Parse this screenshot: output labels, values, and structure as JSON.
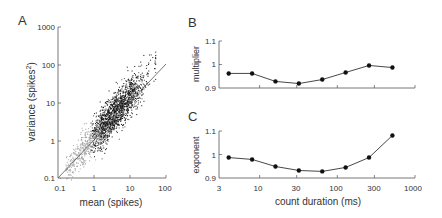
{
  "chart_data": [
    {
      "panel": "A",
      "type": "scatter",
      "xlabel": "mean (spikes)",
      "ylabel": "variance (spikes²)",
      "xscale": "log",
      "yscale": "log",
      "xlim": [
        0.1,
        100
      ],
      "ylim": [
        0.1,
        1000
      ],
      "xticks": [
        "0.1",
        "1",
        "10",
        "100"
      ],
      "yticks": [
        "0.1",
        "1",
        "10",
        "100",
        "1000"
      ],
      "reference_line": "unity (variance = mean)",
      "description": "Dense cloud of points, mostly between mean 0.5–30 and variance 0.5–100, lying near/slightly above unity line; lighter gray points at low means"
    },
    {
      "panel": "B",
      "type": "line",
      "ylabel": "multiplier",
      "xscale": "log",
      "xlim": [
        3,
        1000
      ],
      "ylim": [
        0.9,
        1.1
      ],
      "yticks": [
        "0.9",
        "1",
        "1.1"
      ],
      "x": [
        4,
        8,
        16,
        32,
        64,
        128,
        256,
        512
      ],
      "values": [
        0.962,
        0.962,
        0.928,
        0.919,
        0.936,
        0.966,
        0.996,
        0.987
      ]
    },
    {
      "panel": "C",
      "type": "line",
      "ylabel": "exponent",
      "xlabel": "count duration (ms)",
      "xscale": "log",
      "xlim": [
        3,
        1000
      ],
      "ylim": [
        0.9,
        1.1
      ],
      "xticks": [
        "3",
        "10",
        "30",
        "100",
        "300",
        "1000"
      ],
      "yticks": [
        "0.9",
        "1",
        "1.1"
      ],
      "x": [
        4,
        8,
        16,
        32,
        64,
        128,
        256,
        512
      ],
      "values": [
        0.987,
        0.979,
        0.949,
        0.932,
        0.928,
        0.945,
        0.987,
        1.081
      ]
    }
  ],
  "labels": {
    "panelA": "A",
    "panelB": "B",
    "panelC": "C",
    "a_xlabel": "mean (spikes)",
    "a_ylabel_main": "variance (spikes",
    "a_ylabel_sup": "2",
    "a_ylabel_end": ")",
    "b_ylabel": "multiplier",
    "c_ylabel": "exponent",
    "c_xlabel": "count duration (ms)",
    "a_xticks": [
      "0.1",
      "1",
      "10",
      "100"
    ],
    "a_yticks": [
      "1000",
      "100",
      "10",
      "1",
      "0.1"
    ],
    "bc_yticks": [
      "1.1",
      "1",
      "0.9"
    ],
    "c_xticks": [
      "3",
      "10",
      "30",
      "100",
      "300",
      "1000"
    ]
  }
}
